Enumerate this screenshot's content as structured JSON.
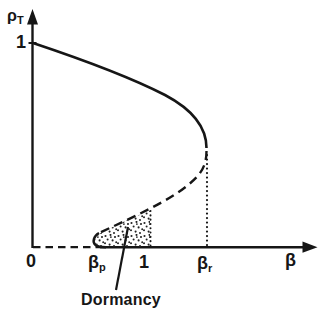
{
  "colors": {
    "ink": "#161616",
    "background": "#ffffff"
  },
  "labels": {
    "y_axis": {
      "symbol": "ρ",
      "subscript": "T"
    },
    "y_tick": "1",
    "origin": "0",
    "beta_p": {
      "symbol": "β",
      "subscript": "p"
    },
    "x_tick_one": "1",
    "beta_r": {
      "symbol": "β",
      "subscript": "r"
    },
    "x_axis": {
      "symbol": "β"
    },
    "dormancy": "Dormancy"
  },
  "chart_data": {
    "type": "line",
    "title": "",
    "xlabel": "β",
    "ylabel": "ρ_T",
    "xlim": [
      0,
      2.4
    ],
    "ylim": [
      0,
      1.15
    ],
    "grid": false,
    "x_ticks": [
      {
        "value": 0,
        "label": "0"
      },
      {
        "value": 0.56,
        "label": "β_p"
      },
      {
        "value": 1,
        "label": "1"
      },
      {
        "value": 1.47,
        "label": "β_r"
      }
    ],
    "y_ticks": [
      {
        "value": 1,
        "label": "1"
      }
    ],
    "series": [
      {
        "name": "upper-stable-branch",
        "style": "solid",
        "points_beta_rho": [
          [
            0,
            1
          ],
          [
            0.3,
            0.93
          ],
          [
            0.74,
            0.86
          ],
          [
            1.12,
            0.75
          ],
          [
            1.35,
            0.64
          ],
          [
            1.46,
            0.55
          ],
          [
            1.47,
            0.49
          ]
        ]
      },
      {
        "name": "middle-unstable-branch",
        "style": "dashed",
        "points_beta_rho": [
          [
            1.47,
            0.47
          ],
          [
            1.41,
            0.35
          ],
          [
            1.31,
            0.3
          ],
          [
            1.09,
            0.21
          ],
          [
            0.84,
            0.12
          ],
          [
            0.64,
            0.08
          ],
          [
            0.56,
            0.07
          ]
        ]
      },
      {
        "name": "lower-fold-hook",
        "style": "solid",
        "points_beta_rho": [
          [
            0.56,
            0.07
          ],
          [
            0.51,
            0.03
          ],
          [
            0.53,
            0.01
          ],
          [
            0.62,
            0
          ]
        ]
      },
      {
        "name": "zero-branch",
        "style": "dashed",
        "points_beta_rho": [
          [
            0,
            0
          ],
          [
            0.56,
            0
          ]
        ]
      }
    ],
    "guides": [
      {
        "name": "beta-r-dotted-drop",
        "style": "dotted",
        "from": [
          1.47,
          0.46
        ],
        "to": [
          1.47,
          0
        ]
      },
      {
        "name": "one-dotted-drop",
        "style": "dotted",
        "from": [
          1,
          0.175
        ],
        "to": [
          1,
          0
        ]
      }
    ],
    "annotations": [
      {
        "text": "Dormancy",
        "points_to": "stippled region between β_p and 1 near ρ_T = 0"
      }
    ],
    "render": {
      "viewbox": "0 0 327 318",
      "ink": "#161616",
      "primitives": [
        {
          "kind": "line",
          "name": "y-axis",
          "x1": 32.5,
          "y1": 248,
          "x2": 32.5,
          "y2": 22,
          "w": 2.4
        },
        {
          "kind": "polygon",
          "name": "y-axis-arrowhead",
          "points": "32.5,9 27,24.5 38,24.5"
        },
        {
          "kind": "line",
          "name": "x-axis",
          "x1": 100,
          "y1": 247.2,
          "x2": 304,
          "y2": 247.2,
          "w": 2.4
        },
        {
          "kind": "polygon",
          "name": "x-axis-arrowhead",
          "points": "317.5,247.2 302.5,241.6 302.5,252.8"
        },
        {
          "kind": "line",
          "name": "zero-branch-dashed",
          "x1": 33,
          "y1": 247.2,
          "x2": 100,
          "y2": 247.2,
          "w": 2.2,
          "dash": "7.5 5"
        },
        {
          "kind": "line",
          "name": "y-tick-one",
          "x1": 28.5,
          "y1": 43,
          "x2": 36.5,
          "y2": 43,
          "w": 2
        },
        {
          "kind": "path",
          "name": "upper-stable-branch",
          "d": "M 33 43 Q 120 72 165 95 Q 206.5 117 206.5 148",
          "w": 2.6
        },
        {
          "kind": "path",
          "name": "middle-unstable-branch",
          "d": "M 206.5 151 C 206.5 168 199 176 188 185 C 170 200 140 214 99 233",
          "w": 2.4,
          "dash": "9 5.5"
        },
        {
          "kind": "path",
          "name": "lower-fold-hook",
          "d": "M 99 233 C 93.5 236 92 242 95.5 245 C 97.5 246.8 101.5 247.2 106 247.2",
          "w": 2.4
        },
        {
          "kind": "line",
          "name": "beta-r-dotted-drop",
          "x1": 207,
          "y1": 155,
          "x2": 207,
          "y2": 246,
          "w": 2.2,
          "dash": "0.1 4.4",
          "cap": "round"
        },
        {
          "kind": "line",
          "name": "one-dotted-drop",
          "x1": 150.5,
          "y1": 211,
          "x2": 150.5,
          "y2": 246,
          "w": 2,
          "dash": "0.1 4.2",
          "cap": "round"
        },
        {
          "kind": "path",
          "name": "dormancy-stipple-region",
          "fill": "url(#stipple)",
          "d": "M 99.5 233.5 C 95 236.5 93.5 242 96.5 244.8 C 98.5 246.6 102 246.9 106 246.9 L 150 246.9 L 150 210.5 C 132 217.5 114.5 226 99.5 233.5 Z"
        },
        {
          "kind": "line",
          "name": "dormancy-pointer-line",
          "x1": 116,
          "y1": 290,
          "x2": 128,
          "y2": 227,
          "w": 2.2
        }
      ]
    }
  }
}
